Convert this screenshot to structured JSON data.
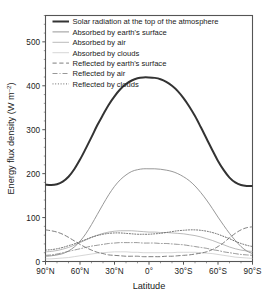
{
  "chart_data": {
    "type": "line",
    "title": "",
    "xlabel": "Latitude",
    "ylabel": "Energy flux density (W m⁻²)",
    "ylabel_main": "Energy flux density (W m",
    "ylabel_exp": "–2",
    "ylabel_tail": ")",
    "xlim": [
      -90,
      90
    ],
    "ylim": [
      0,
      560
    ],
    "grid": false,
    "legend_position": "top-center",
    "x_ticks": [
      -90,
      -60,
      -30,
      0,
      30,
      60,
      90
    ],
    "x_tick_labels": [
      "90°N",
      "60°N",
      "30°N",
      "0°",
      "30°S",
      "60°S",
      "90°S"
    ],
    "y_ticks": [
      0,
      100,
      200,
      300,
      400,
      500
    ],
    "y_tick_labels": [
      "0",
      "100",
      "200",
      "300",
      "400",
      "500"
    ],
    "x": [
      -90,
      -85,
      -80,
      -75,
      -70,
      -65,
      -60,
      -55,
      -50,
      -45,
      -40,
      -35,
      -30,
      -25,
      -20,
      -15,
      -10,
      -5,
      0,
      5,
      10,
      15,
      20,
      25,
      30,
      35,
      40,
      45,
      50,
      55,
      60,
      65,
      70,
      75,
      80,
      85,
      90
    ],
    "series": [
      {
        "name": "Solar radiation at the top of the atmosphere",
        "style": "solid",
        "width": 2.0,
        "color": "#333333",
        "values": [
          175,
          174,
          176,
          182,
          193,
          210,
          232,
          257,
          283,
          310,
          334,
          357,
          376,
          392,
          404,
          412,
          417,
          419,
          419,
          418,
          415,
          409,
          400,
          388,
          372,
          353,
          331,
          306,
          280,
          254,
          229,
          208,
          191,
          180,
          174,
          172,
          172
        ]
      },
      {
        "name": "Absorbed by earth's surface",
        "style": "solid",
        "width": 0.9,
        "color": "#8c8c8c",
        "values": [
          12,
          13,
          15,
          18,
          24,
          33,
          46,
          63,
          84,
          107,
          130,
          152,
          171,
          186,
          197,
          205,
          209,
          211,
          211,
          211,
          210,
          208,
          205,
          200,
          193,
          184,
          172,
          157,
          140,
          121,
          101,
          82,
          64,
          48,
          34,
          24,
          18
        ]
      },
      {
        "name": "Absorbed by air",
        "style": "solid",
        "width": 0.8,
        "color": "#a8a8a8",
        "values": [
          22,
          23,
          25,
          28,
          32,
          37,
          43,
          49,
          55,
          60,
          64,
          67,
          69,
          70,
          70,
          70,
          69,
          68,
          67,
          67,
          66,
          66,
          65,
          64,
          63,
          61,
          59,
          56,
          52,
          48,
          43,
          38,
          33,
          29,
          26,
          24,
          23
        ]
      },
      {
        "name": "Absorbed by clouds",
        "style": "solid",
        "width": 0.7,
        "color": "#c4c4c4",
        "values": [
          6,
          6,
          7,
          8,
          9,
          11,
          13,
          15,
          17,
          19,
          20,
          21,
          22,
          22,
          22,
          21,
          21,
          20,
          20,
          20,
          20,
          20,
          20,
          21,
          21,
          21,
          21,
          20,
          19,
          18,
          16,
          14,
          12,
          10,
          9,
          8,
          7
        ]
      },
      {
        "name": "Reflected by earth's surface",
        "style": "dashed",
        "width": 0.9,
        "color": "#6f6f6f",
        "values": [
          72,
          70,
          67,
          62,
          55,
          47,
          39,
          32,
          26,
          21,
          18,
          15,
          14,
          13,
          12,
          12,
          12,
          11,
          11,
          11,
          11,
          12,
          12,
          13,
          14,
          15,
          17,
          19,
          22,
          27,
          34,
          43,
          54,
          64,
          72,
          77,
          79
        ]
      },
      {
        "name": "Reflected by air",
        "style": "dashdot",
        "width": 0.8,
        "color": "#7d7d7d",
        "values": [
          14,
          15,
          17,
          20,
          23,
          26,
          29,
          32,
          35,
          37,
          39,
          41,
          42,
          43,
          43,
          43,
          43,
          42,
          42,
          42,
          41,
          41,
          40,
          39,
          38,
          36,
          34,
          32,
          30,
          27,
          25,
          22,
          20,
          18,
          16,
          15,
          14
        ]
      },
      {
        "name": "Reflected by clouds",
        "style": "dotted",
        "width": 0.9,
        "color": "#5a5a5a",
        "values": [
          26,
          27,
          29,
          32,
          36,
          40,
          45,
          50,
          55,
          59,
          62,
          64,
          65,
          65,
          64,
          63,
          62,
          62,
          62,
          63,
          64,
          66,
          68,
          70,
          71,
          72,
          72,
          71,
          69,
          66,
          62,
          57,
          52,
          46,
          41,
          37,
          34
        ]
      }
    ]
  },
  "legend": {
    "items": [
      "Solar radiation at the top of the atmosphere",
      "Absorbed by earth's surface",
      "Absorbed by air",
      "Absorbed by clouds",
      "Reflected by earth's surface",
      "Reflected by air",
      "Reflected by clouds"
    ]
  },
  "colors": {
    "frame": "#555555",
    "background": "#ffffff",
    "text": "#1a1a1a"
  }
}
